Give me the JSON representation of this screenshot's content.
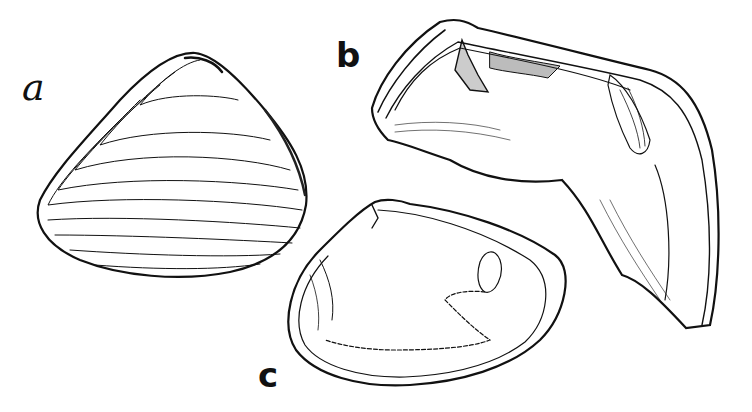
{
  "figure": {
    "labels": {
      "a": "a",
      "b": "b",
      "c": "c"
    },
    "panels": [
      {
        "id": "a",
        "description": "exterior view of a triangular bivalve shell with concentric growth lines"
      },
      {
        "id": "b",
        "description": "broken hinge fragment of a large bivalve showing the hinge teeth and muscle scar"
      },
      {
        "id": "c",
        "description": "interior view of a bivalve valve showing muscle scars and pallial sinus"
      }
    ],
    "colors": {
      "ink": "#111111",
      "paper": "#ffffff"
    }
  }
}
